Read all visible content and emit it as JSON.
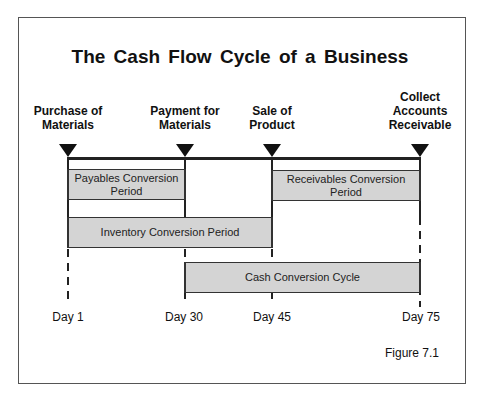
{
  "title": "The Cash Flow Cycle of a Business",
  "events": [
    {
      "label_line1": "Purchase of",
      "label_line2": "Materials",
      "label_line0": ""
    },
    {
      "label_line1": "Payment for",
      "label_line2": "Materials",
      "label_line0": ""
    },
    {
      "label_line1": "Sale of",
      "label_line2": "Product",
      "label_line0": ""
    },
    {
      "label_line0": "Collect",
      "label_line1": "Accounts",
      "label_line2": "Receivable"
    }
  ],
  "periods": [
    {
      "line1": "Payables Conversion",
      "line2": "Period",
      "from": "Day 1",
      "to": "Day 30"
    },
    {
      "line1": "Receivables Conversion",
      "line2": "Period",
      "from": "Day 45",
      "to": "Day 75"
    },
    {
      "line1": "Inventory Conversion Period",
      "line2": "",
      "from": "Day 1",
      "to": "Day 45"
    },
    {
      "line1": "Cash Conversion Cycle",
      "line2": "",
      "from": "Day 30",
      "to": "Day 75"
    }
  ],
  "days": [
    "Day 1",
    "Day 30",
    "Day 45",
    "Day 75"
  ],
  "figure_label": "Figure 7.1"
}
